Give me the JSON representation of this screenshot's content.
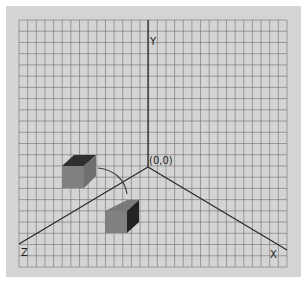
{
  "diagram": {
    "colors": {
      "panel_bg": "#d4d4d4",
      "grid_line": "#6e6e6e",
      "axis_line": "#2a2a2a",
      "box_front": "#808080",
      "box_top": "#2e2e2e",
      "box_side": "#232323",
      "arrow": "#3a3a3a"
    },
    "grid": {
      "x0": 19,
      "y0": 20,
      "x1": 287,
      "y1": 267,
      "cols": 31,
      "rows": 22
    },
    "origin": {
      "x": 148,
      "y": 167,
      "label": "(0,0)"
    },
    "axes": [
      {
        "name": "Y",
        "label": "Y",
        "end_x": 148,
        "end_y": 20,
        "label_x": 150,
        "label_y": 45
      },
      {
        "name": "X",
        "label": "X",
        "end_x": 287,
        "end_y": 250,
        "label_x": 270,
        "label_y": 258
      },
      {
        "name": "Z",
        "label": "Z",
        "end_x": 19,
        "end_y": 244,
        "label_x": 21,
        "label_y": 256
      }
    ],
    "boxes": [
      {
        "name": "box-before",
        "description": "box with dark top face (original orientation)"
      },
      {
        "name": "box-after",
        "description": "box with dark side face (rotated orientation)"
      }
    ],
    "arrow": {
      "description": "curved rotation arrow from lower box to upper box"
    }
  }
}
